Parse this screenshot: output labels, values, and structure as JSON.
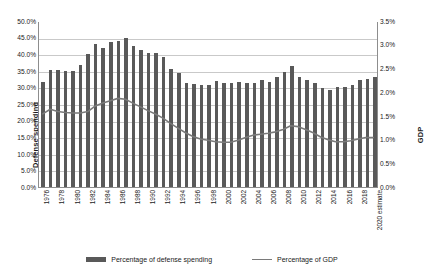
{
  "chart_data": {
    "type": "bar",
    "title": "",
    "xlabel": "",
    "ylabel": "Defense spending",
    "y2label": "GDP",
    "grid": true,
    "legend_position": "bottom",
    "ylim": [
      0,
      50
    ],
    "y2lim": [
      0,
      3.5
    ],
    "ytick_labels": [
      "50.0%",
      "45.0%",
      "40.0%",
      "35.0%",
      "30.0%",
      "25.0%",
      "20.0%",
      "15.0%",
      "10.0%",
      "5.0%",
      "0.0%"
    ],
    "ytick_values": [
      50,
      45,
      40,
      35,
      30,
      25,
      20,
      15,
      10,
      5,
      0
    ],
    "y2tick_labels": [
      "3.5%",
      "3.0%",
      "2.5%",
      "2.0%",
      "1.5%",
      "1.0%",
      "0.5%",
      "0.0%"
    ],
    "y2tick_values": [
      3.5,
      3.0,
      2.5,
      2.0,
      1.5,
      1.0,
      0.5,
      0.0
    ],
    "categories": [
      "1976",
      "1977",
      "1978",
      "1979",
      "1980",
      "1981",
      "1982",
      "1983",
      "1984",
      "1985",
      "1986",
      "1987",
      "1988",
      "1989",
      "1990",
      "1991",
      "1992",
      "1993",
      "1994",
      "1995",
      "1996",
      "1997",
      "1998",
      "1999",
      "2000",
      "2001",
      "2002",
      "2003",
      "2004",
      "2005",
      "2006",
      "2007",
      "2008",
      "2009",
      "2010",
      "2011",
      "2012",
      "2013",
      "2014",
      "2015",
      "2016",
      "2017",
      "2018",
      "2019",
      "2020 estimate"
    ],
    "xtick_labels": [
      "1976",
      "1978",
      "1980",
      "1982",
      "1984",
      "1986",
      "1988",
      "1990",
      "1992",
      "1994",
      "1996",
      "1998",
      "2000",
      "2002",
      "2004",
      "2006",
      "2008",
      "2010",
      "2012",
      "2014",
      "2016",
      "2018",
      "2020 estimate"
    ],
    "series": [
      {
        "name": "Percentage of defense spending",
        "axis": "left",
        "type": "bar",
        "color": "#595959",
        "values": [
          31.5,
          35.3,
          35.2,
          35.0,
          34.8,
          36.7,
          40.0,
          43.0,
          41.8,
          43.8,
          44.1,
          45.0,
          42.5,
          41.3,
          40.4,
          40.3,
          39.2,
          35.5,
          34.3,
          31.2,
          30.9,
          30.8,
          30.8,
          32.0,
          31.4,
          31.2,
          31.6,
          31.2,
          31.2,
          32.1,
          31.6,
          33.0,
          34.6,
          36.6,
          33.0,
          32.1,
          31.3,
          29.8,
          29.3,
          30.2,
          30.1,
          30.8,
          32.2,
          32.6,
          33.2
        ]
      },
      {
        "name": "Percentage of GDP",
        "axis": "right",
        "type": "line",
        "color": "#7a7a7a",
        "values": [
          1.55,
          1.65,
          1.6,
          1.58,
          1.57,
          1.57,
          1.6,
          1.72,
          1.78,
          1.83,
          1.88,
          1.86,
          1.78,
          1.7,
          1.62,
          1.55,
          1.46,
          1.35,
          1.25,
          1.15,
          1.07,
          1.02,
          0.99,
          0.96,
          0.95,
          0.95,
          0.99,
          1.05,
          1.1,
          1.12,
          1.14,
          1.17,
          1.22,
          1.3,
          1.28,
          1.22,
          1.15,
          1.06,
          1.0,
          0.96,
          0.96,
          0.98,
          1.02,
          1.05,
          1.05
        ]
      }
    ],
    "legend": [
      {
        "label": "Percentage of defense spending",
        "marker": "bar",
        "color": "#595959"
      },
      {
        "label": "Percentage of GDP",
        "marker": "line",
        "color": "#7a7a7a"
      }
    ]
  }
}
